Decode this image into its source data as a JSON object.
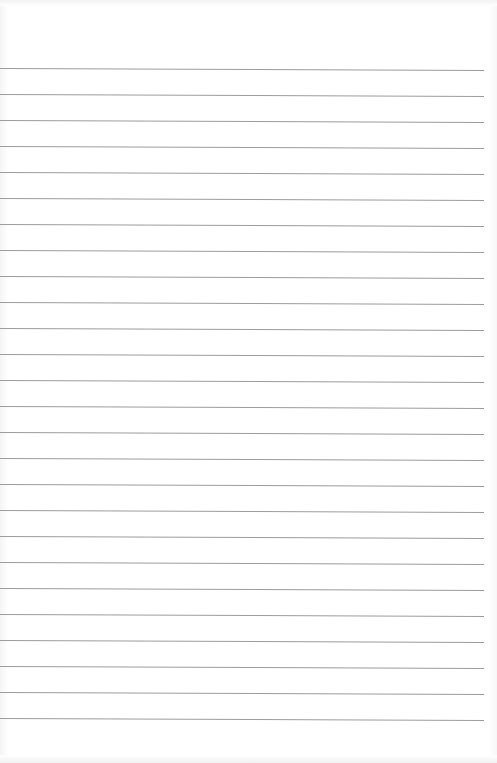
{
  "document": {
    "type": "lined-paper",
    "line_count": 26,
    "first_line_y": 68,
    "line_spacing": 26,
    "line_start_x": 0,
    "line_end_x": 484,
    "line_color": "#9c9c9c",
    "background_color": "#ffffff",
    "text_content": []
  }
}
